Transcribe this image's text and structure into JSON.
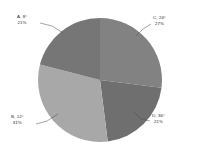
{
  "chart_data": {
    "type": "pie",
    "title": "",
    "subtitle": "",
    "xlabel": "",
    "ylabel": "",
    "legend_position": "none",
    "grid": false,
    "labels_outside": true,
    "leader_lines": true,
    "start_angle_deg": 0,
    "direction": "clockwise",
    "categories": [
      "A",
      "B",
      "C",
      "D"
    ],
    "values": [
      21,
      31,
      27,
      21
    ],
    "slices": [
      {
        "name": "A",
        "angle_label": "8°",
        "percent_label": "21%",
        "percent": 21,
        "color": "#767676",
        "label_line1": "A,  8°",
        "label_line2": "21%",
        "position": "upper-left"
      },
      {
        "name": "B",
        "angle_label": "12°",
        "percent_label": "31%",
        "percent": 31,
        "color": "#a8a8a8",
        "label_line1": "B,  12°",
        "label_line2": "31%",
        "position": "lower-left"
      },
      {
        "name": "C",
        "angle_label": "24°",
        "percent_label": "27%",
        "percent": 27,
        "color": "#828282",
        "label_line1": "C,  24°",
        "label_line2": "27%",
        "position": "upper-right"
      },
      {
        "name": "D",
        "angle_label": "36°",
        "percent_label": "21%",
        "percent": 21,
        "color": "#6f6f6f",
        "label_line2": "21%",
        "label_line1": "D,  36°",
        "position": "lower-right"
      }
    ],
    "geometry": {
      "center_x": 100,
      "center_y": 80,
      "radius": 62
    },
    "background_color": "#ffffff",
    "text_color": "#2b2b2b"
  }
}
